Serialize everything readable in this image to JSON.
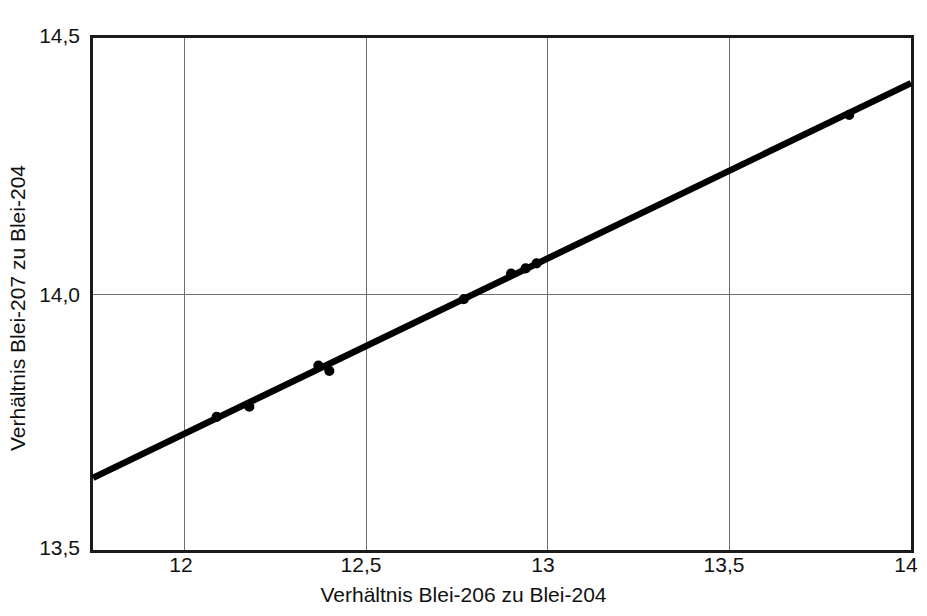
{
  "chart_data": {
    "type": "scatter",
    "title": "",
    "subtitle": "",
    "xlabel": "Verhältnis Blei-206 zu Blei-204",
    "ylabel": "Verhältnis Blei-207 zu Blei-204",
    "xlim": [
      11.75,
      14.0
    ],
    "ylim": [
      13.5,
      14.5
    ],
    "grid": true,
    "legend": null,
    "xticks": [
      {
        "value": 12.0,
        "label": "12"
      },
      {
        "value": 12.5,
        "label": "12,5"
      },
      {
        "value": 13.0,
        "label": "13"
      },
      {
        "value": 13.5,
        "label": "13,5"
      },
      {
        "value": 14.0,
        "label": "14"
      }
    ],
    "yticks": [
      {
        "value": 13.5,
        "label": "13,5"
      },
      {
        "value": 14.0,
        "label": "14,0"
      },
      {
        "value": 14.5,
        "label": "14,5"
      }
    ],
    "series": [
      {
        "name": "Messpunkte",
        "type": "scatter",
        "marker": "circle",
        "color": "#000000",
        "points": [
          {
            "x": 12.09,
            "y": 13.76
          },
          {
            "x": 12.18,
            "y": 13.78
          },
          {
            "x": 12.37,
            "y": 13.86
          },
          {
            "x": 12.4,
            "y": 13.85
          },
          {
            "x": 12.77,
            "y": 13.99
          },
          {
            "x": 12.9,
            "y": 14.04
          },
          {
            "x": 12.94,
            "y": 14.05
          },
          {
            "x": 12.97,
            "y": 14.06
          },
          {
            "x": 13.83,
            "y": 14.35
          }
        ]
      },
      {
        "name": "Regressionsgerade",
        "type": "line",
        "color": "#000000",
        "x": [
          11.75,
          14.0
        ],
        "y": [
          13.641,
          14.412
        ]
      }
    ]
  },
  "axes": {
    "frame_color": "#1a1a1a",
    "grid_color": "#6f6f6f"
  }
}
